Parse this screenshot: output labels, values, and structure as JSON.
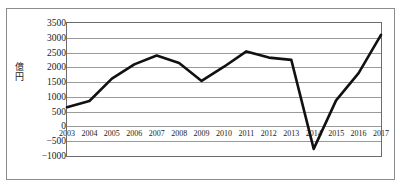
{
  "chart_data": {
    "type": "line",
    "title": "",
    "subtitle": "",
    "xlabel": "",
    "ylabel": "億円",
    "categories": [
      "2003",
      "2004",
      "2005",
      "2006",
      "2007",
      "2008",
      "2009",
      "2010",
      "2011",
      "2012",
      "2013",
      "2014",
      "2015",
      "2016",
      "2017"
    ],
    "values": [
      650,
      860,
      1620,
      2100,
      2400,
      2150,
      1540,
      2020,
      2540,
      2330,
      2250,
      -760,
      880,
      1800,
      3100
    ],
    "series": [
      {
        "name": "",
        "values": [
          650,
          860,
          1620,
          2100,
          2400,
          2150,
          1540,
          2020,
          2540,
          2330,
          2250,
          -760,
          880,
          1800,
          3100
        ]
      }
    ],
    "ylim": [
      -1000,
      3500
    ],
    "yticks": [
      3500,
      3000,
      2500,
      2000,
      1500,
      1000,
      500,
      0,
      -500,
      -1000
    ],
    "ytick_labels": [
      "3500",
      "3000",
      "2500",
      "2000",
      "1500",
      "1000",
      "500",
      "0",
      "−500",
      "−1000"
    ],
    "grid": true,
    "legend": "none",
    "line_color": "#111111",
    "grid_color": "#9a9a9a",
    "axis_color": "#6b6b6b",
    "background_color": "#ffffff",
    "annotations": []
  }
}
